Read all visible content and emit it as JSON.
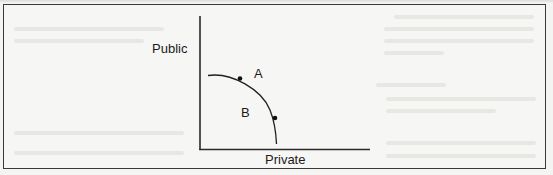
{
  "figure": {
    "type": "production-possibilities-frontier",
    "y_axis_label": "Public",
    "x_axis_label": "Private",
    "points": [
      {
        "id": "A",
        "label": "A",
        "position": "on-frontier"
      },
      {
        "id": "B",
        "label": "B",
        "position": "inside-frontier"
      }
    ]
  },
  "colors": {
    "ink": "#1b1b1b",
    "frame": "#3a3a3a",
    "paper": "#f4f4f2"
  }
}
